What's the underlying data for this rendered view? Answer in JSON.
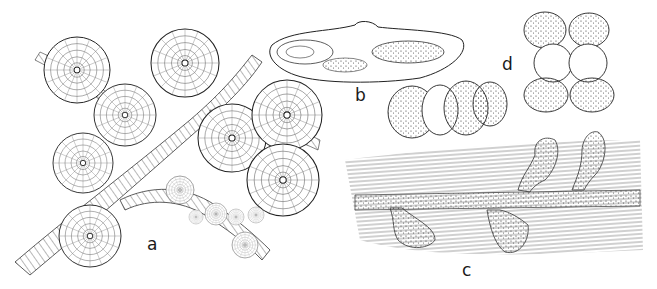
{
  "figure": {
    "background": "#ffffff",
    "ink": "#1a1a1a",
    "panels": [
      {
        "id": "a",
        "label": "a",
        "content": "Large disc-shaped radially striated bodies on branching fibrous strands, with smaller discs along lower strand"
      },
      {
        "id": "b",
        "label": "b",
        "content": "Elongated lens-shaped section with two internal oval chambers"
      },
      {
        "id": "c",
        "label": "c",
        "content": "Stippled hypha lying across fibrous strands with club-shaped stippled outgrowths"
      },
      {
        "id": "d",
        "label": "d",
        "content": "Cluster of spiny stippled cells around two smooth central cells"
      }
    ],
    "unlabeled": [
      {
        "content": "Cluster of spiny stippled and smooth cells (between b and c)"
      }
    ]
  }
}
